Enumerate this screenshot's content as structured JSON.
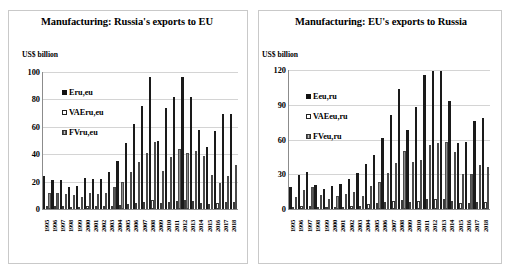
{
  "page": {
    "background": "#ffffff",
    "accent": "#1a1a1a"
  },
  "charts": [
    {
      "id": "russia-exports-to-eu",
      "title": "Manufacturing: Russia's exports to EU",
      "unit_label": "US$ billion",
      "legend": [
        {
          "label": "Eru,eu",
          "style": "filled-black"
        },
        {
          "label": "VAEru,eu",
          "style": "open-white"
        },
        {
          "label": "FVru,eu",
          "style": "gray-hatched"
        }
      ],
      "ylabel": "US$ billion",
      "yticks": [
        "0",
        "20",
        "40",
        "60",
        "80",
        "100"
      ]
    },
    {
      "id": "eu-exports-to-russia",
      "title": "Manufacturing: EU's exports to Russia",
      "unit_label": "US$ billion",
      "legend": [
        {
          "label": "Eeu,ru",
          "style": "filled-black"
        },
        {
          "label": "VAEeu,ru",
          "style": "open-white"
        },
        {
          "label": "FVeu,ru",
          "style": "gray-hatched"
        }
      ],
      "ylabel": "US$ billion",
      "yticks": [
        "0",
        "30",
        "60",
        "90",
        "120"
      ]
    }
  ],
  "chart_data": [
    {
      "type": "bar",
      "title": "Manufacturing: Russia's exports to EU",
      "xlabel": "",
      "ylabel": "US$ billion",
      "ylim": [
        0,
        100
      ],
      "yticks": [
        0,
        20,
        40,
        60,
        80,
        100
      ],
      "grid": true,
      "legend_position": "inside-upper-left",
      "categories": [
        "1995",
        "1996",
        "1997",
        "1998",
        "1999",
        "2000",
        "2001",
        "2002",
        "2003",
        "2004",
        "2005",
        "2006",
        "2007",
        "2008",
        "2009",
        "2010",
        "2011",
        "2012",
        "2013",
        "2014",
        "2015",
        "2016",
        "2017",
        "2018"
      ],
      "series": [
        {
          "name": "Eru,eu",
          "style": "filled-black",
          "values": [
            24,
            21,
            21,
            16,
            17,
            23,
            22,
            22,
            27,
            35,
            48,
            62,
            75,
            96,
            50,
            74,
            82,
            96,
            82,
            58,
            45,
            57,
            69,
            69
          ]
        },
        {
          "name": "VAEru,eu",
          "style": "open-white",
          "values": [
            2,
            2,
            2,
            1.5,
            1.5,
            2,
            2,
            2,
            2.5,
            3,
            4,
            4.5,
            5,
            6.5,
            4.5,
            5,
            6,
            6.5,
            6,
            4.5,
            4,
            4.5,
            5,
            5
          ]
        },
        {
          "name": "FVru,eu",
          "style": "gray-hatched",
          "values": [
            12,
            12,
            11,
            10,
            9,
            12,
            11,
            12,
            16,
            20,
            27,
            34,
            41,
            49,
            28,
            38,
            44,
            41,
            42,
            39,
            25,
            19,
            24,
            32
          ]
        }
      ]
    },
    {
      "type": "bar",
      "title": "Manufacturing: EU's exports to Russia",
      "xlabel": "",
      "ylabel": "US$ billion",
      "ylim": [
        0,
        120
      ],
      "yticks": [
        0,
        30,
        60,
        90,
        120
      ],
      "grid": true,
      "legend_position": "inside-upper-left",
      "categories": [
        "1995",
        "1996",
        "1997",
        "1998",
        "1999",
        "2000",
        "2001",
        "2002",
        "2003",
        "2004",
        "2005",
        "2006",
        "2007",
        "2008",
        "2009",
        "2010",
        "2011",
        "2012",
        "2013",
        "2014",
        "2015",
        "2016",
        "2017",
        "2018"
      ],
      "series": [
        {
          "name": "Eeu,ru",
          "style": "filled-black",
          "values": [
            19,
            29,
            32,
            21,
            17,
            20,
            22,
            26,
            31,
            39,
            47,
            61,
            81,
            104,
            68,
            88,
            116,
            119,
            119,
            93,
            57,
            58,
            76,
            79
          ]
        },
        {
          "name": "VAEeu,ru",
          "style": "open-white",
          "values": [
            2,
            3,
            3,
            2,
            2,
            2,
            2,
            3,
            3,
            4,
            5,
            6,
            7,
            8,
            6,
            7,
            9,
            9,
            9,
            7,
            5,
            5,
            6,
            6
          ]
        },
        {
          "name": "FVeu,ru",
          "style": "gray-hatched",
          "values": [
            10,
            16,
            19,
            12,
            9,
            11,
            13,
            15,
            11,
            20,
            23,
            31,
            40,
            50,
            41,
            42,
            55,
            57,
            58,
            49,
            30,
            30,
            38,
            36
          ]
        }
      ]
    }
  ]
}
